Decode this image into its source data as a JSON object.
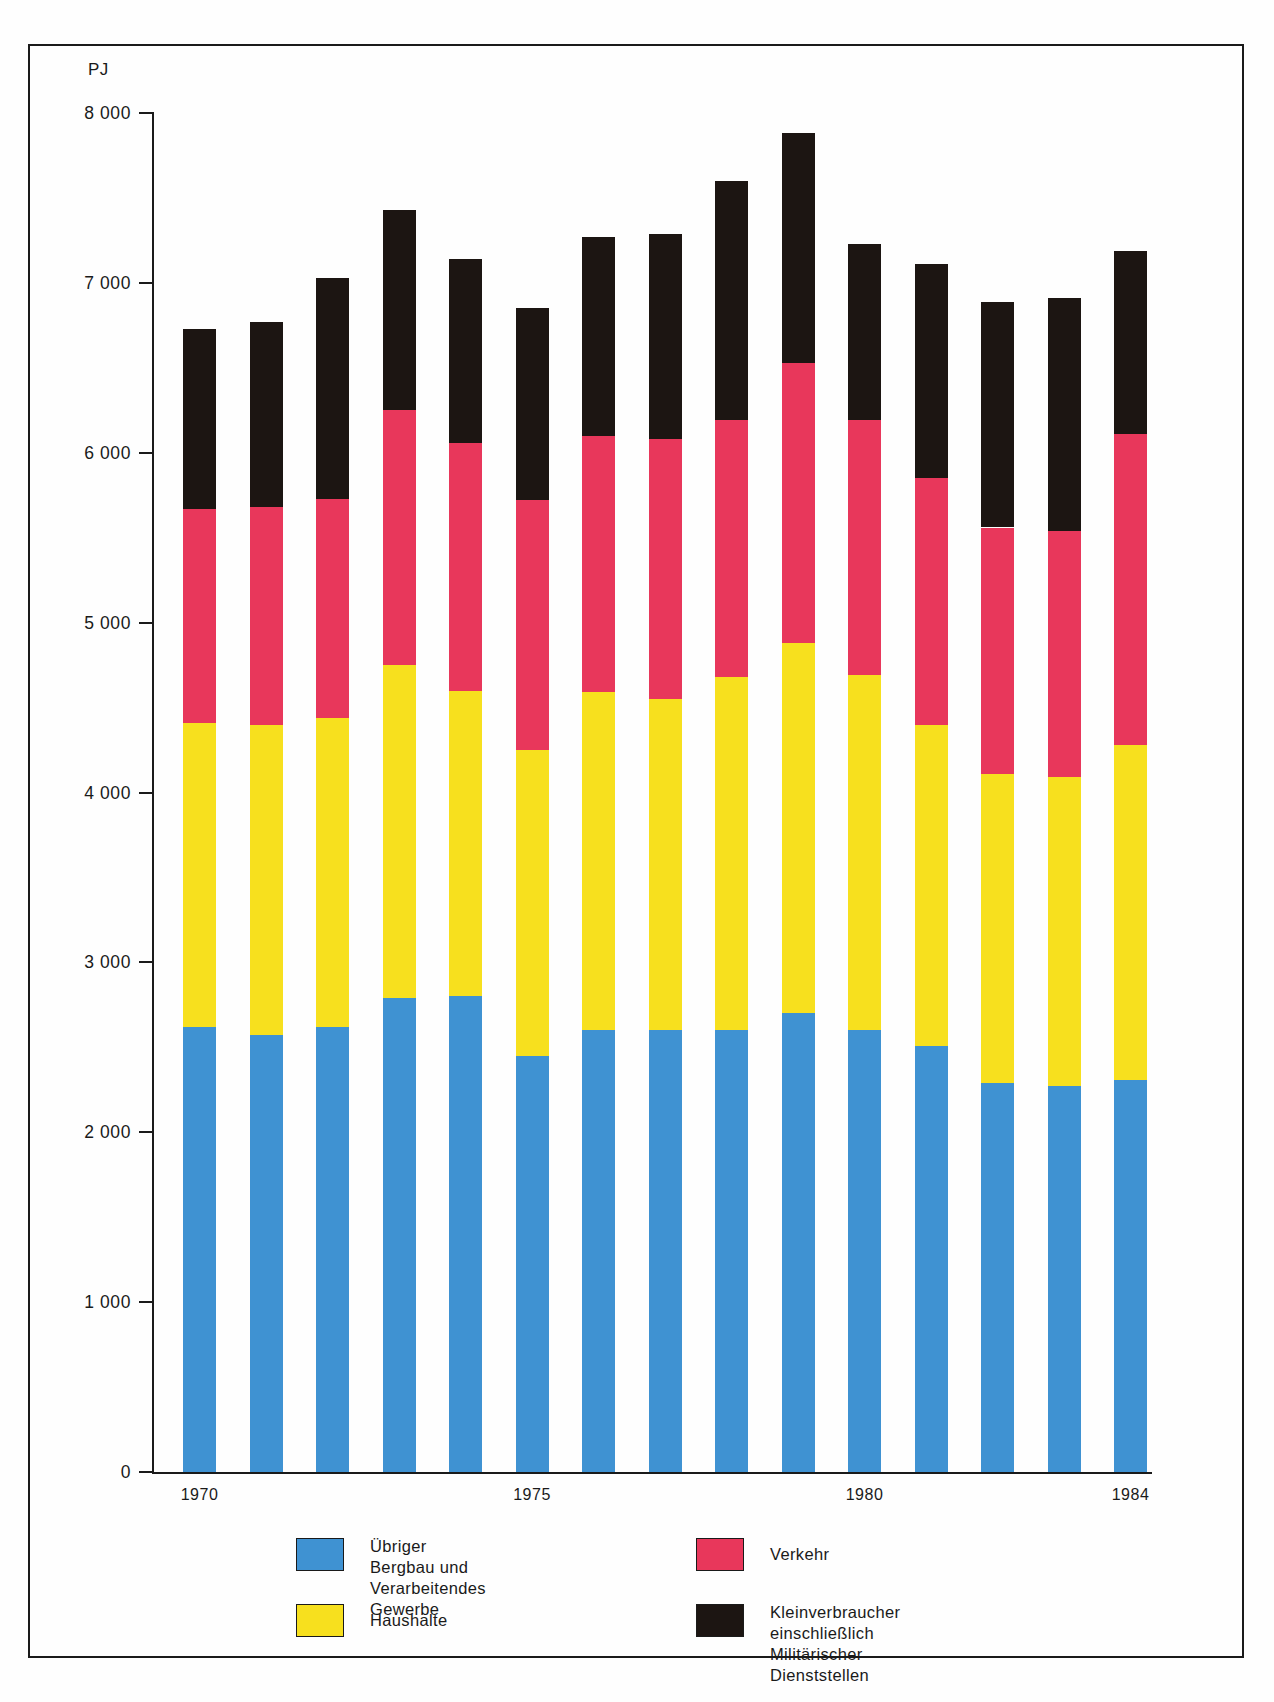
{
  "chart_data": {
    "type": "bar",
    "subtype": "stacked",
    "title": "",
    "unit_label": "PJ",
    "xlabel": "",
    "ylabel": "PJ",
    "ylim": [
      0,
      8000
    ],
    "yticks": [
      0,
      1000,
      2000,
      3000,
      4000,
      5000,
      6000,
      7000,
      8000
    ],
    "ytick_labels": [
      "0",
      "1 000",
      "2 000",
      "3 000",
      "4 000",
      "5 000",
      "6 000",
      "7 000",
      "8 000"
    ],
    "grid": false,
    "legend_position": "bottom",
    "categories": [
      1970,
      1971,
      1972,
      1973,
      1974,
      1975,
      1976,
      1977,
      1978,
      1979,
      1980,
      1981,
      1982,
      1983,
      1984
    ],
    "xtick_labels": [
      "1970",
      "1975",
      "1980",
      "1984"
    ],
    "xtick_categories": [
      1970,
      1975,
      1980,
      1984
    ],
    "series": [
      {
        "name": "Übriger Bergbau und\nVerarbeitendes Gewerbe",
        "label_line1": "Übriger Bergbau und",
        "label_line2": "Verarbeitendes Gewerbe",
        "color": "#3f92d2",
        "values": [
          2620,
          2570,
          2620,
          2790,
          2800,
          2450,
          2600,
          2600,
          2600,
          2700,
          2600,
          2510,
          2290,
          2270,
          2310
        ]
      },
      {
        "name": "Haushalte",
        "label_line1": "Haushalte",
        "label_line2": "",
        "color": "#f7e01e",
        "values": [
          1790,
          1830,
          1820,
          1960,
          1800,
          1800,
          1990,
          1950,
          2080,
          2180,
          2090,
          1890,
          1820,
          1820,
          1970
        ]
      },
      {
        "name": "Verkehr",
        "label_line1": "Verkehr",
        "label_line2": "",
        "color": "#e8375b",
        "values": [
          1260,
          1280,
          1290,
          1500,
          1460,
          1470,
          1510,
          1530,
          1510,
          1650,
          1500,
          1450,
          1450,
          1450,
          1830
        ]
      },
      {
        "name": "Kleinverbraucher einschließlich\nMilitärischer Dienststellen",
        "label_line1": "Kleinverbraucher einschließlich",
        "label_line2": "Militärischer Dienststellen",
        "color": "#1c1512",
        "values": [
          1060,
          1090,
          1300,
          1180,
          1080,
          1130,
          1170,
          1210,
          1410,
          1350,
          1040,
          1260,
          1330,
          1370,
          1080
        ]
      }
    ],
    "totals": [
      6730,
      6770,
      7030,
      7430,
      7140,
      6850,
      7270,
      7290,
      7600,
      7880,
      7230,
      7110,
      6890,
      6910,
      7190
    ]
  },
  "legend": {
    "items": [
      {
        "swatch_class": "lg-blue",
        "name": "legend-blue",
        "line1": "Übriger Bergbau und",
        "line2": "Verarbeitendes Gewerbe"
      },
      {
        "swatch_class": "lg-yellow",
        "name": "legend-yellow",
        "line1": "Haushalte",
        "line2": ""
      },
      {
        "swatch_class": "lg-red",
        "name": "legend-red",
        "line1": "Verkehr",
        "line2": ""
      },
      {
        "swatch_class": "lg-black",
        "name": "legend-black",
        "line1": "Kleinverbraucher einschließlich",
        "line2": "Militärischer Dienststellen"
      }
    ]
  }
}
